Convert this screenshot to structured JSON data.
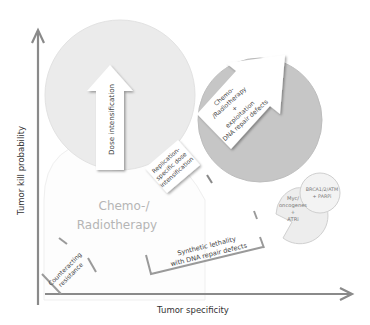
{
  "axes": {
    "y_label": "Tumor kill probability",
    "x_label": "Tumor specificity",
    "color": "#8a8a8a"
  },
  "regions": {
    "chemo_radio_circle": {
      "label_line1": "Chemo-/",
      "label_line2": "Radiotherapy",
      "fill": "#fdfdfd",
      "text_color": "#b5b5b5"
    },
    "dose_circle": {
      "fill": "#ebebeb"
    },
    "exploitation_circle": {
      "fill": "#c6c6c6"
    },
    "myc_circle": {
      "line1": "Myc/",
      "line2": "oncogenes",
      "line3": "+",
      "line4": "ATRi",
      "fill": "#ededed"
    },
    "brca_circle": {
      "line1": "BRCA1/2/ATM",
      "line2": "+ PARPi",
      "fill": "#f3f3f3"
    }
  },
  "arrows": {
    "dose_intensification": {
      "label": "Dose intensification"
    },
    "exploitation": {
      "line1": "Chemo-",
      "line2": "/Radiotherapy",
      "line3": "+",
      "line4": "exploitation",
      "line5": "DNA repair defects"
    },
    "replication_specific": {
      "line1": "Replication-",
      "line2": "specific dose",
      "line3": "intensification"
    },
    "synthetic_lethality": {
      "line1": "Synthetic lethality",
      "line2": "with DNA repair defects"
    },
    "counteracting_resistance": {
      "line1": "Counteracting",
      "line2": "resistance"
    }
  }
}
